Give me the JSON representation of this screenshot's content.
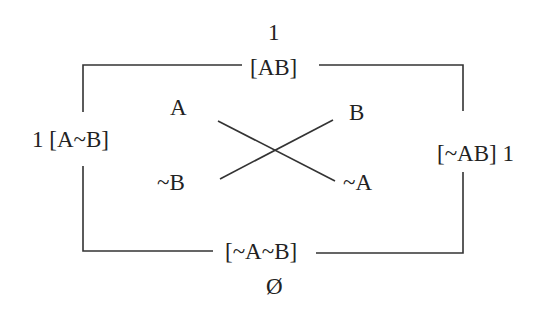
{
  "diagram": {
    "type": "square-of-opposition-truth-table",
    "colors": {
      "line": "#333333",
      "text": "#222222",
      "background": "#ffffff"
    },
    "top": {
      "value": "1",
      "label": "[AB]"
    },
    "left": {
      "value": "1",
      "label": "[A~B]"
    },
    "right": {
      "label": "[~AB]",
      "value": "1"
    },
    "bottom": {
      "label": "[~A~B]",
      "value": "Ø"
    },
    "cross": {
      "top_left": "A",
      "top_right": "B",
      "bottom_left": "~B",
      "bottom_right": "~A"
    },
    "left_full": "1 [A~B]",
    "right_full": "[~AB] 1"
  }
}
